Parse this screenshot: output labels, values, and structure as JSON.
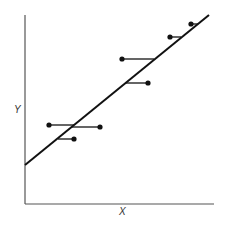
{
  "chart_data": {
    "type": "scatter",
    "title": "",
    "xlabel": "X",
    "ylabel": "Y",
    "grid": false,
    "legend": null,
    "regression_line": {
      "x1": 25,
      "y1": 165,
      "x2": 209,
      "y2": 15
    },
    "points": [
      {
        "x": 191,
        "y": 24,
        "residual_to_x": 198
      },
      {
        "x": 170,
        "y": 37,
        "residual_to_x": 181
      },
      {
        "x": 122,
        "y": 59,
        "residual_to_x": 154
      },
      {
        "x": 148,
        "y": 83,
        "residual_to_x": 126
      },
      {
        "x": 49,
        "y": 125,
        "residual_to_x": 74
      },
      {
        "x": 100,
        "y": 127,
        "residual_to_x": 72
      },
      {
        "x": 74,
        "y": 139,
        "residual_to_x": 58
      }
    ],
    "note": "Horizontal residual segments from each point to the fitted line; coordinates are pixel positions"
  },
  "labels": {
    "x": "X",
    "y": "Y"
  },
  "colors": {
    "line": "#111111",
    "axis": "#555555",
    "point": "#111111"
  }
}
